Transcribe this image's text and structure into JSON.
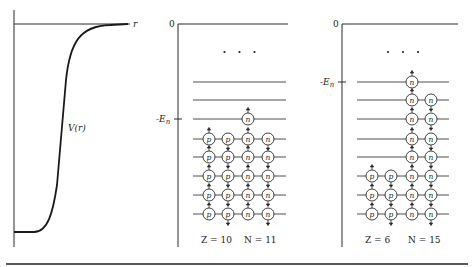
{
  "figure": {
    "potential_panel": {
      "axis_label_r": "r",
      "curve_label": "V(r)"
    },
    "panels": [
      {
        "id": "neon-21",
        "zero_label": "0",
        "fermi_label": "-E",
        "fermi_subscript": "n",
        "ellipsis": "· · ·",
        "caption_z": "Z = 10",
        "caption_n": "N = 11",
        "levels_bottom_to_top": [
          {
            "protons": 2,
            "neutrons": 2
          },
          {
            "protons": 2,
            "neutrons": 2
          },
          {
            "protons": 2,
            "neutrons": 2
          },
          {
            "protons": 2,
            "neutrons": 2
          },
          {
            "protons": 2,
            "neutrons": 2
          },
          {
            "protons": 0,
            "neutrons": 1
          },
          {
            "protons": 0,
            "neutrons": 0
          },
          {
            "protons": 0,
            "neutrons": 0
          }
        ],
        "fermi_level_index": 5
      },
      {
        "id": "carbon-21",
        "zero_label": "0",
        "fermi_label": "-E",
        "fermi_subscript": "n",
        "ellipsis": "· · ·",
        "caption_z": "Z = 6",
        "caption_n": "N = 15",
        "levels_bottom_to_top": [
          {
            "protons": 2,
            "neutrons": 2
          },
          {
            "protons": 2,
            "neutrons": 2
          },
          {
            "protons": 2,
            "neutrons": 2
          },
          {
            "protons": 0,
            "neutrons": 2
          },
          {
            "protons": 0,
            "neutrons": 2
          },
          {
            "protons": 0,
            "neutrons": 2
          },
          {
            "protons": 0,
            "neutrons": 2
          },
          {
            "protons": 0,
            "neutrons": 1
          }
        ],
        "fermi_level_index": 7
      }
    ],
    "particle_labels": {
      "proton": "p",
      "neutron": "n"
    }
  }
}
